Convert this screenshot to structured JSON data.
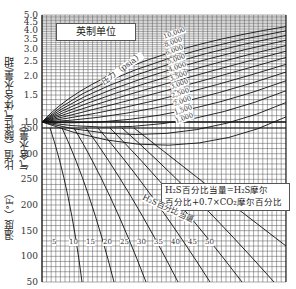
{
  "chart_data": [
    {
      "type": "line",
      "title": "英制单位",
      "ylabel": "比值（酸性气体含水量 / 甜气含水量）",
      "yticks": [
        "1.0",
        "1.5",
        "2.0",
        "2.5",
        "3.0",
        "3.5",
        "4.0",
        "4.5",
        "5.0"
      ],
      "ylim": [
        1.0,
        5.0
      ],
      "yscale": "log",
      "grid": true,
      "curve_family_label": "压力（psia）",
      "series": [
        {
          "name": "10,000"
        },
        {
          "name": "8,000"
        },
        {
          "name": "6,000"
        },
        {
          "name": "5,000"
        },
        {
          "name": "4,000"
        },
        {
          "name": "3,500"
        },
        {
          "name": "3,000"
        },
        {
          "name": "2,500"
        },
        {
          "name": "2,000"
        },
        {
          "name": "1,500"
        },
        {
          "name": "1,000"
        },
        {
          "name": "600"
        },
        {
          "name": "200"
        }
      ]
    },
    {
      "type": "line",
      "ylabel": "温度（°F）",
      "yticks": [
        "50",
        "100",
        "150",
        "200",
        "250",
        "300",
        "350"
      ],
      "ylim": [
        50,
        350
      ],
      "grid": true,
      "curve_family_label": "H₂S百分比当量",
      "series_labels": [
        "5",
        "10",
        "15",
        "20",
        "25",
        "30",
        "35",
        "40",
        "45",
        "50"
      ],
      "annotation": "H₂S百分比当量=H₂S摩尔百分比+0.7×CO₂摩尔百分比"
    }
  ],
  "labels": {
    "title": "英制单位",
    "ylabel_top_prefix": "比值（",
    "ylabel_top_num": "酸性气体含水量",
    "ylabel_top_den": "甜气含水量",
    "ylabel_bottom": "温度（°F）",
    "pressure_label": "压力（psia）",
    "h2s_label": "H₂S百分比当量",
    "note_line1": "H₂S百分比当量=H₂S摩尔",
    "note_line2": "百分比+0.7×CO₂摩尔百分比"
  },
  "top_yticks": [
    {
      "label": "5.0",
      "v": 5.0
    },
    {
      "label": "4.5",
      "v": 4.5
    },
    {
      "label": "4.0",
      "v": 4.0
    },
    {
      "label": "3.5",
      "v": 3.5
    },
    {
      "label": "3.0",
      "v": 3.0
    },
    {
      "label": "2.5",
      "v": 2.5
    },
    {
      "label": "2.0",
      "v": 2.0
    },
    {
      "label": "1.5",
      "v": 1.5
    },
    {
      "label": "1.0",
      "v": 1.0
    }
  ],
  "bottom_yticks": [
    {
      "label": "350",
      "v": 350
    },
    {
      "label": "300",
      "v": 300
    },
    {
      "label": "250",
      "v": 250
    },
    {
      "label": "200",
      "v": 200
    },
    {
      "label": "150",
      "v": 150
    },
    {
      "label": "100",
      "v": 100
    },
    {
      "label": "50",
      "v": 50
    }
  ],
  "pressure_labels": [
    "10,000",
    "8,000",
    "6,000",
    "5,000",
    "4,000",
    "3,500",
    "3,000",
    "2,500",
    "2,000",
    "1,500",
    "1,000"
  ],
  "h2s_values": [
    "5",
    "10",
    "15",
    "20",
    "25",
    "30",
    "35",
    "40",
    "45",
    "50"
  ]
}
